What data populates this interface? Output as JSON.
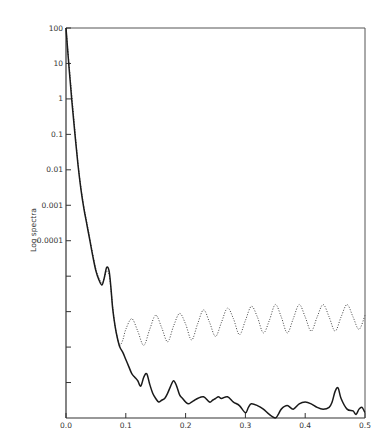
{
  "chart_data": {
    "type": "line",
    "title": "",
    "xlabel": "",
    "ylabel": "Log spectra",
    "xlim": [
      0.0,
      0.5
    ],
    "ylim_log10": [
      -9,
      2
    ],
    "yscale": "log",
    "grid": false,
    "legend": null,
    "x_ticks": [
      {
        "value": 0.0,
        "label": "0.0"
      },
      {
        "value": 0.1,
        "label": "0.1"
      },
      {
        "value": 0.2,
        "label": "0.2"
      },
      {
        "value": 0.3,
        "label": "0.3"
      },
      {
        "value": 0.4,
        "label": "0.4"
      },
      {
        "value": 0.5,
        "label": "0.5"
      }
    ],
    "y_ticks": [
      {
        "log10": 2,
        "label": "100"
      },
      {
        "log10": 1,
        "label": "10"
      },
      {
        "log10": 0,
        "label": "1"
      },
      {
        "log10": -1,
        "label": "0.1"
      },
      {
        "log10": -2,
        "label": "0.01"
      },
      {
        "log10": -3,
        "label": "0.001"
      },
      {
        "log10": -4,
        "label": "0.0001"
      },
      {
        "log10": -5,
        "label": ""
      },
      {
        "log10": -6,
        "label": ""
      },
      {
        "log10": -7,
        "label": ""
      },
      {
        "log10": -8,
        "label": ""
      }
    ],
    "series": [
      {
        "name": "solid",
        "style": "solid",
        "x": [
          0.0,
          0.005,
          0.01,
          0.015,
          0.02,
          0.025,
          0.03,
          0.035,
          0.04,
          0.045,
          0.05,
          0.055,
          0.06,
          0.064,
          0.068,
          0.072,
          0.075,
          0.078,
          0.082,
          0.086,
          0.09,
          0.095,
          0.1,
          0.105,
          0.11,
          0.115,
          0.12,
          0.125,
          0.13,
          0.135,
          0.14,
          0.145,
          0.15,
          0.155,
          0.16,
          0.165,
          0.17,
          0.175,
          0.18,
          0.185,
          0.19,
          0.195,
          0.2,
          0.205,
          0.21,
          0.215,
          0.22,
          0.23,
          0.24,
          0.245,
          0.25,
          0.255,
          0.26,
          0.27,
          0.28,
          0.29,
          0.3,
          0.305,
          0.31,
          0.32,
          0.33,
          0.34,
          0.35,
          0.355,
          0.36,
          0.37,
          0.38,
          0.39,
          0.4,
          0.41,
          0.42,
          0.43,
          0.44,
          0.445,
          0.45,
          0.455,
          0.46,
          0.47,
          0.48,
          0.485,
          0.49,
          0.495,
          0.5
        ],
        "log10_y": [
          2.0,
          0.9,
          -0.1,
          -1.0,
          -1.85,
          -2.55,
          -3.1,
          -3.55,
          -4.0,
          -4.45,
          -4.85,
          -5.1,
          -5.25,
          -5.05,
          -4.75,
          -4.85,
          -5.3,
          -5.9,
          -6.4,
          -6.75,
          -7.0,
          -7.15,
          -7.35,
          -7.55,
          -7.75,
          -7.85,
          -7.95,
          -8.1,
          -7.85,
          -7.75,
          -8.05,
          -8.3,
          -8.45,
          -8.55,
          -8.5,
          -8.45,
          -8.3,
          -8.1,
          -7.95,
          -8.1,
          -8.35,
          -8.45,
          -8.55,
          -8.6,
          -8.55,
          -8.5,
          -8.45,
          -8.4,
          -8.55,
          -8.5,
          -8.45,
          -8.4,
          -8.45,
          -8.4,
          -8.55,
          -8.65,
          -8.85,
          -8.7,
          -8.6,
          -8.65,
          -8.75,
          -8.9,
          -9.0,
          -8.9,
          -8.75,
          -8.65,
          -8.75,
          -8.6,
          -8.55,
          -8.6,
          -8.7,
          -8.75,
          -8.7,
          -8.55,
          -8.25,
          -8.15,
          -8.45,
          -8.75,
          -8.8,
          -8.9,
          -8.75,
          -8.7,
          -8.85
        ]
      },
      {
        "name": "dotted",
        "style": "dotted",
        "oscillation_period": 0.04,
        "x": [
          0.0,
          0.005,
          0.01,
          0.015,
          0.02,
          0.025,
          0.03,
          0.035,
          0.04,
          0.045,
          0.05,
          0.055,
          0.06,
          0.064,
          0.068,
          0.072,
          0.075,
          0.078,
          0.082,
          0.086,
          0.09,
          0.095,
          0.1,
          0.11,
          0.12,
          0.13,
          0.14,
          0.15,
          0.16,
          0.17,
          0.18,
          0.19,
          0.2,
          0.21,
          0.22,
          0.23,
          0.24,
          0.25,
          0.26,
          0.27,
          0.28,
          0.29,
          0.3,
          0.31,
          0.32,
          0.33,
          0.34,
          0.35,
          0.36,
          0.37,
          0.38,
          0.39,
          0.4,
          0.41,
          0.42,
          0.43,
          0.44,
          0.45,
          0.46,
          0.47,
          0.48,
          0.49,
          0.5
        ],
        "log10_y": [
          2.0,
          1.0,
          0.05,
          -0.9,
          -1.8,
          -2.5,
          -3.05,
          -3.5,
          -3.95,
          -4.4,
          -4.8,
          -5.05,
          -5.2,
          -5.05,
          -4.85,
          -4.95,
          -5.35,
          -5.85,
          -6.4,
          -6.75,
          -6.95,
          -6.8,
          -6.5,
          -6.2,
          -6.55,
          -6.95,
          -6.5,
          -6.1,
          -6.45,
          -6.85,
          -6.4,
          -6.05,
          -6.35,
          -6.8,
          -6.35,
          -5.95,
          -6.3,
          -6.7,
          -6.3,
          -5.9,
          -6.2,
          -6.65,
          -6.25,
          -5.85,
          -6.15,
          -6.6,
          -6.25,
          -5.8,
          -6.15,
          -6.6,
          -6.2,
          -5.8,
          -6.15,
          -6.55,
          -6.15,
          -5.8,
          -6.15,
          -6.55,
          -6.15,
          -5.8,
          -6.15,
          -6.5,
          -6.1
        ]
      }
    ]
  }
}
